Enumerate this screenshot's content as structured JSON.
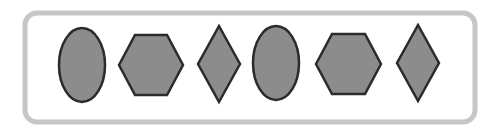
{
  "diagram": {
    "type": "shape-sequence",
    "frame": {
      "x": 25,
      "y": 13,
      "width": 450,
      "height": 109,
      "radius": 12,
      "stroke": "#c6c6c6",
      "stroke_width": 5
    },
    "style": {
      "fill": "#8c8c8c",
      "stroke": "#2b2b2b",
      "stroke_width": 2.5
    },
    "shapes": [
      {
        "kind": "ellipse",
        "cx": 82,
        "cy": 65,
        "rx": 23,
        "ry": 37
      },
      {
        "kind": "hexagon",
        "points": "119,65 135,35 167,35 183,65 167,95 135,95"
      },
      {
        "kind": "diamond",
        "points": "219,26 240,64 219,102 198,64"
      },
      {
        "kind": "ellipse",
        "cx": 276,
        "cy": 63,
        "rx": 23,
        "ry": 37
      },
      {
        "kind": "hexagon",
        "points": "316,64 332,34 365,34 381,64 365,94 332,94"
      },
      {
        "kind": "diamond",
        "points": "418,25 439,63 418,101 397,63"
      }
    ]
  }
}
